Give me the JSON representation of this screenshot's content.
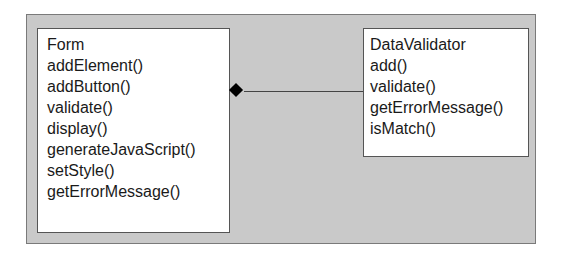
{
  "diagram": {
    "type": "UML class diagram",
    "relationship": "composition",
    "classes": [
      {
        "name": "Form",
        "methods": [
          "addElement()",
          "addButton()",
          "validate()",
          "display()",
          "generateJavaScript()",
          "setStyle()",
          "getErrorMessage()"
        ]
      },
      {
        "name": "DataValidator",
        "methods": [
          "add()",
          "validate()",
          "getErrorMessage()",
          "isMatch()"
        ]
      }
    ],
    "colors": {
      "background": "#c9c9c9",
      "class_fill": "#ffffff",
      "line": "#444444",
      "diamond": "#000000"
    }
  }
}
